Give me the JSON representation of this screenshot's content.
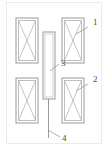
{
  "figure": {
    "type": "patent-technical-drawing",
    "width": 108,
    "height": 146,
    "background_color": "#fefefe",
    "line_color": "#9a9a9a",
    "inner_line_color": "#b5b5b5",
    "label_color": "#4a4a4a",
    "frame": {
      "visible": true,
      "color": "#e6e6e6"
    }
  },
  "parts": [
    {
      "ref": "1",
      "name": "upper-right-winding-block",
      "label": "1",
      "label_x": 93,
      "label_y": 25,
      "leader_from_x": 88,
      "leader_from_y": 27,
      "leader_to_x": 76,
      "leader_to_y": 34
    },
    {
      "ref": "2",
      "name": "lower-right-winding-block",
      "label": "2",
      "label_x": 93,
      "label_y": 82,
      "leader_from_x": 88,
      "leader_from_y": 84,
      "leader_to_x": 76,
      "leader_to_y": 91
    },
    {
      "ref": "3",
      "name": "central-vertical-member",
      "label": "3",
      "label_x": 61,
      "label_y": 66,
      "leader_from_x": 59,
      "leader_from_y": 64,
      "leader_to_x": 50,
      "leader_to_y": 71
    },
    {
      "ref": "4",
      "name": "lower-shaft",
      "label": "4",
      "label_x": 62,
      "label_y": 140,
      "leader_from_x": 60,
      "leader_from_y": 137,
      "leader_to_x": 48,
      "leader_to_y": 130
    }
  ],
  "blocks": [
    {
      "name": "upper-left-winding-block",
      "x": 16,
      "y": 18,
      "width": 22,
      "height": 45,
      "hatch": "cross-diagonal"
    },
    {
      "name": "upper-right-winding-block",
      "x": 62,
      "y": 18,
      "width": 22,
      "height": 45,
      "hatch": "cross-diagonal"
    },
    {
      "name": "lower-left-winding-block",
      "x": 16,
      "y": 78,
      "width": 22,
      "height": 45,
      "hatch": "cross-diagonal"
    },
    {
      "name": "lower-right-winding-block",
      "x": 62,
      "y": 78,
      "width": 22,
      "height": 45,
      "hatch": "cross-diagonal"
    }
  ],
  "center_member": {
    "name": "central-vertical-member",
    "x": 43,
    "y": 32,
    "width": 12,
    "height": 67
  },
  "shaft": {
    "name": "lower-shaft",
    "x": 48.5,
    "y_top": 99,
    "y_bottom": 138
  }
}
